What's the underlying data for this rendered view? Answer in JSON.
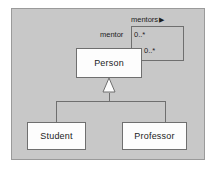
{
  "diagram": {
    "type": "uml-class-diagram",
    "canvas": {
      "background_color": "#c8c8c8",
      "border_color": "#9a9a9a",
      "page_background_color": "#ffffff"
    },
    "classes": [
      {
        "id": "person",
        "name": "Person",
        "fill_color": "#fdfdfd",
        "border_color": "#6f6f6f"
      },
      {
        "id": "student",
        "name": "Student",
        "fill_color": "#fdfdfd",
        "border_color": "#6f6f6f"
      },
      {
        "id": "professor",
        "name": "Professor",
        "fill_color": "#fdfdfd",
        "border_color": "#6f6f6f"
      }
    ],
    "associations": [
      {
        "id": "mentors",
        "kind": "self-association",
        "source": "Person",
        "target": "Person",
        "name": "mentors",
        "name_direction_marker": "▶",
        "source_role": "mentor",
        "source_multiplicity": "0..*",
        "target_multiplicity": "0..*"
      }
    ],
    "generalizations": [
      {
        "id": "student-person",
        "subclass": "Student",
        "superclass": "Person",
        "arrow": "hollow-triangle"
      },
      {
        "id": "professor-person",
        "subclass": "Professor",
        "superclass": "Person",
        "arrow": "hollow-triangle"
      }
    ],
    "line_color": "#6f6f6f"
  }
}
